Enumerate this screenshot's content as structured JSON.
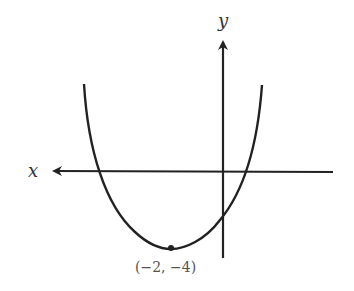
{
  "diagram": {
    "type": "parabola-graph",
    "axes": {
      "x_label": "x",
      "y_label": "y"
    },
    "vertex": {
      "label": "(−2, −4)",
      "x": -2,
      "y": -4
    },
    "curve": {
      "description": "upward-opening parabola with vertex at (-2,-4)",
      "color": "#222222"
    },
    "colors": {
      "axis": "#222222",
      "background": "#ffffff"
    }
  }
}
